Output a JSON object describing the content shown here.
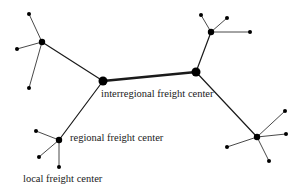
{
  "diagram": {
    "type": "hierarchical freight network",
    "colors": {
      "line": "#1a1a1a",
      "node": "#000000",
      "background": "#ffffff"
    },
    "labels": {
      "interregional": "interregional freight center",
      "regional": "regional freight center",
      "local": "local freight center"
    },
    "nodes": [
      {
        "id": "I1",
        "level": "interregional",
        "x": 103,
        "y": 81,
        "r": 4.5
      },
      {
        "id": "I2",
        "level": "interregional",
        "x": 196,
        "y": 72,
        "r": 4.5
      },
      {
        "id": "R1",
        "level": "regional",
        "x": 42,
        "y": 42,
        "r": 3.2
      },
      {
        "id": "R2",
        "level": "regional",
        "x": 211,
        "y": 32,
        "r": 3.2
      },
      {
        "id": "R3",
        "level": "regional",
        "x": 257,
        "y": 137,
        "r": 3.2
      },
      {
        "id": "R4",
        "level": "regional",
        "x": 59,
        "y": 140,
        "r": 3.2
      },
      {
        "id": "L1",
        "level": "local",
        "x": 29,
        "y": 14,
        "r": 2
      },
      {
        "id": "L2",
        "level": "local",
        "x": 17,
        "y": 49,
        "r": 2
      },
      {
        "id": "L3",
        "level": "local",
        "x": 29,
        "y": 88,
        "r": 2
      },
      {
        "id": "L4",
        "level": "local",
        "x": 201,
        "y": 15,
        "r": 2
      },
      {
        "id": "L5",
        "level": "local",
        "x": 227,
        "y": 18,
        "r": 2
      },
      {
        "id": "L6",
        "level": "local",
        "x": 250,
        "y": 32,
        "r": 2
      },
      {
        "id": "L7",
        "level": "local",
        "x": 285,
        "y": 111,
        "r": 2
      },
      {
        "id": "L8",
        "level": "local",
        "x": 286,
        "y": 134,
        "r": 2
      },
      {
        "id": "L9",
        "level": "local",
        "x": 227,
        "y": 147,
        "r": 2
      },
      {
        "id": "L10",
        "level": "local",
        "x": 269,
        "y": 161,
        "r": 2
      },
      {
        "id": "L11",
        "level": "local",
        "x": 36,
        "y": 131,
        "r": 2
      },
      {
        "id": "L12",
        "level": "local",
        "x": 39,
        "y": 157,
        "r": 2
      },
      {
        "id": "L13",
        "level": "local",
        "x": 59,
        "y": 167,
        "r": 2
      }
    ],
    "edges": [
      {
        "from": "I1",
        "to": "I2",
        "w": 2.4
      },
      {
        "from": "I1",
        "to": "R1",
        "w": 1.2
      },
      {
        "from": "I1",
        "to": "R4",
        "w": 1.2
      },
      {
        "from": "I2",
        "to": "R2",
        "w": 1.2
      },
      {
        "from": "I2",
        "to": "R3",
        "w": 1.2
      },
      {
        "from": "R1",
        "to": "L1",
        "w": 0.8
      },
      {
        "from": "R1",
        "to": "L2",
        "w": 0.8
      },
      {
        "from": "R1",
        "to": "L3",
        "w": 0.8
      },
      {
        "from": "R2",
        "to": "L4",
        "w": 0.8
      },
      {
        "from": "R2",
        "to": "L5",
        "w": 0.8
      },
      {
        "from": "R2",
        "to": "L6",
        "w": 0.8
      },
      {
        "from": "R3",
        "to": "L7",
        "w": 0.8
      },
      {
        "from": "R3",
        "to": "L8",
        "w": 0.8
      },
      {
        "from": "R3",
        "to": "L9",
        "w": 0.8
      },
      {
        "from": "R3",
        "to": "L10",
        "w": 0.8
      },
      {
        "from": "R4",
        "to": "L11",
        "w": 0.8
      },
      {
        "from": "R4",
        "to": "L12",
        "w": 0.8
      },
      {
        "from": "R4",
        "to": "L13",
        "w": 0.8
      }
    ],
    "label_positions": {
      "interregional": {
        "x": 101,
        "y": 97
      },
      "regional": {
        "x": 70,
        "y": 141
      },
      "local": {
        "x": 23,
        "y": 182
      }
    }
  }
}
